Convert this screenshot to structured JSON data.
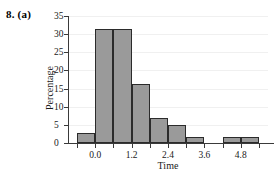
{
  "figure": {
    "label": "8. (a)"
  },
  "chart_data": {
    "type": "bar",
    "title": "",
    "subtitle": "",
    "xlabel": "Time",
    "ylabel": "Percentage",
    "grid": true,
    "legend": null,
    "xlim": [
      -0.9,
      5.7
    ],
    "ylim": [
      0,
      35
    ],
    "xticks": [
      0.0,
      1.2,
      2.4,
      3.6,
      4.8
    ],
    "xtick_labels": [
      "0.0",
      "1.2",
      "2.4",
      "3.6",
      "4.8"
    ],
    "yticks": [
      0,
      5,
      10,
      15,
      20,
      25,
      30,
      35
    ],
    "ytick_labels": [
      "0",
      "5",
      "10",
      "15",
      "20",
      "25",
      "30",
      "35"
    ],
    "bin_width": 0.6,
    "bin_edges": [
      -0.6,
      0.0,
      0.6,
      1.2,
      1.8,
      2.4,
      3.0,
      3.6,
      4.2,
      4.8,
      5.4
    ],
    "categories": [
      "-0.6-0.0",
      "0.0-0.6",
      "0.6-1.2",
      "1.2-1.8",
      "1.8-2.4",
      "2.4-3.0",
      "3.0-3.6",
      "3.6-4.2",
      "4.2-4.8",
      "4.8-5.4"
    ],
    "values": [
      2.8,
      31.5,
      31.5,
      16.4,
      6.9,
      5.0,
      1.7,
      0,
      1.7,
      1.7
    ],
    "bar_fill_color": "#9a9a9a",
    "bar_edge_color": "#2b2b2b",
    "axis_color": "#3a3a3a",
    "grid_color": "#f0f0f0"
  }
}
